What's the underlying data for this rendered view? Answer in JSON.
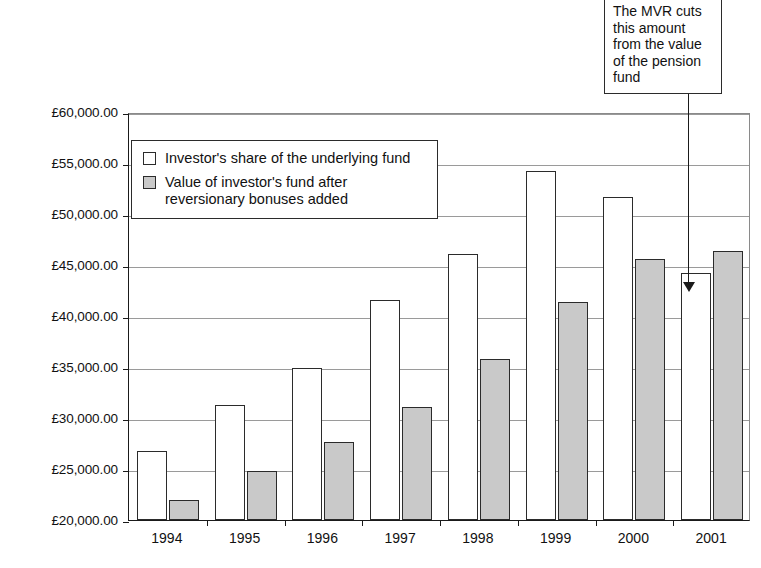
{
  "chart_data": {
    "type": "bar",
    "title": "",
    "xlabel": "",
    "ylabel": "",
    "ylim": [
      20000,
      60000
    ],
    "ytick_values": [
      20000,
      25000,
      30000,
      35000,
      40000,
      45000,
      50000,
      55000,
      60000
    ],
    "ytick_labels": [
      "£20,000.00",
      "£25,000.00",
      "£30,000.00",
      "£35,000.00",
      "£40,000.00",
      "£45,000.00",
      "£50,000.00",
      "£55,000.00",
      "£60,000.00"
    ],
    "categories": [
      "1994",
      "1995",
      "1996",
      "1997",
      "1998",
      "1999",
      "2000",
      "2001"
    ],
    "grid": true,
    "legend_position": "upper-left-inside",
    "series": [
      {
        "name": "Investor's share of the underlying fund",
        "color": "#ffffff",
        "values": [
          26800,
          31300,
          34900,
          41600,
          46100,
          54200,
          51700,
          44200
        ]
      },
      {
        "name": "Value of investor's fund after reversionary bonuses added",
        "color": "#c9c9c9",
        "values": [
          22000,
          24800,
          27600,
          31100,
          35800,
          41400,
          45600,
          46400
        ]
      }
    ],
    "annotations": [
      {
        "text": "The MVR cuts this amount from the value of the pension fund",
        "points_to_category": "2001",
        "points_to_series": "Investor's share of the underlying fund"
      }
    ]
  },
  "legend": {
    "items": [
      {
        "label": "Investor's share of the underlying fund",
        "swatch": "white"
      },
      {
        "label": "Value of investor's fund after reversionary bonuses added",
        "swatch": "gray"
      }
    ]
  },
  "annotation": {
    "text": "The MVR cuts this amount from the value of the pension fund"
  }
}
